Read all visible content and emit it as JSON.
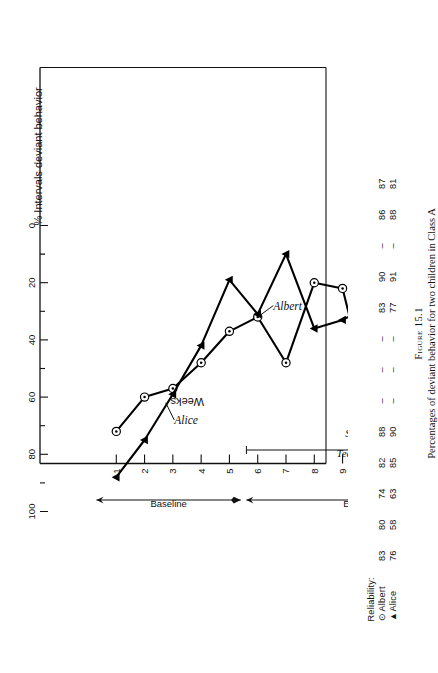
{
  "figure": {
    "number": "Figure 15.1",
    "caption": "Percentages of deviant behavior for two children in Class A"
  },
  "legend": {
    "title": "Reliability:",
    "rows": [
      {
        "marker": "circle-dot",
        "marker_glyph": "⊙",
        "name": "Albert",
        "values": [
          "83",
          "80",
          "74",
          "82",
          "88",
          "–",
          "–",
          "–",
          "83",
          "90",
          "–",
          "86",
          "87"
        ]
      },
      {
        "marker": "triangle",
        "marker_glyph": "▲",
        "name": "Alice",
        "values": [
          "76",
          "58",
          "63",
          "85",
          "90",
          "–",
          "–",
          "–",
          "77",
          "91",
          "–",
          "88",
          "81"
        ]
      }
    ]
  },
  "annotations": {
    "baseline": "Baseline",
    "experimental": "Experimental",
    "teacher": "Teacher: Mrs A",
    "student_teacher": "Student Teacher",
    "albert": "Albert",
    "alice": "Alice"
  },
  "chart_data": {
    "type": "line",
    "title": "",
    "xlabel": "Weeks",
    "ylabel": "% Intervals deviant behavior",
    "xlim": [
      0,
      14
    ],
    "ylim": [
      0,
      100
    ],
    "ytick_labels": [
      "0",
      "20",
      "40",
      "60",
      "80",
      "100"
    ],
    "ytick_values": [
      0,
      20,
      40,
      60,
      80,
      100
    ],
    "yminor_step": 10,
    "xtick_labels": [
      "1",
      "2",
      "3",
      "4",
      "5",
      "6",
      "7",
      "8",
      "9",
      "10",
      "11",
      "12",
      "13",
      "14"
    ],
    "x": [
      1,
      2,
      3,
      4,
      5,
      6,
      7,
      8,
      9,
      10,
      11,
      12,
      13,
      14
    ],
    "grid": false,
    "legend_position": "top-left-outside",
    "series": [
      {
        "name": "Albert",
        "marker": "circle-dot",
        "color": "#000000",
        "values": [
          72,
          60,
          57,
          48,
          37,
          32,
          48,
          20,
          22,
          62,
          30,
          26,
          28,
          28
        ]
      },
      {
        "name": "Alice",
        "marker": "triangle",
        "color": "#000000",
        "values": [
          88,
          75,
          59,
          42,
          19,
          31,
          10,
          36,
          33,
          28,
          37,
          24,
          21,
          21
        ]
      }
    ],
    "phases": [
      {
        "label": "Baseline",
        "from": 0.3,
        "to": 5.4
      },
      {
        "label": "Experimental",
        "from": 5.6,
        "to": 14.4
      }
    ],
    "brackets": [
      {
        "label": "Teacher: Mrs A",
        "from": 5.6,
        "to": 14.4
      },
      {
        "label": "Student Teacher",
        "from": 9.4,
        "to": 11.3
      }
    ]
  }
}
